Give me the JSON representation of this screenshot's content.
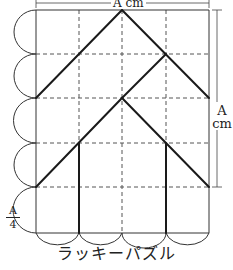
{
  "diagram": {
    "title": "ラッキーパズル",
    "labels": {
      "top_dimension": "A cm",
      "right_dimension_value": "A",
      "right_dimension_unit": "cm",
      "left_fraction_numerator": "A",
      "left_fraction_denominator": "4"
    },
    "grid": {
      "columns": 4,
      "rows": 5,
      "cell": "A/4 square",
      "line_style_inner": "dashed"
    },
    "colors": {
      "line": "#222222",
      "dashed": "#555555",
      "background": "#ffffff"
    }
  }
}
